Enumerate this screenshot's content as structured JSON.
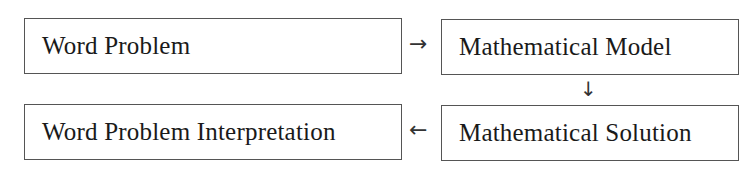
{
  "diagram": {
    "type": "flowchart",
    "nodes": [
      {
        "id": "word_problem",
        "label": "Word Problem"
      },
      {
        "id": "math_model",
        "label": "Mathematical Model"
      },
      {
        "id": "math_solution",
        "label": "Mathematical Solution"
      },
      {
        "id": "interpretation",
        "label": "Word Problem Interpretation"
      }
    ],
    "edges": [
      {
        "from": "word_problem",
        "to": "math_model",
        "glyph": "→"
      },
      {
        "from": "math_model",
        "to": "math_solution",
        "glyph": "↓"
      },
      {
        "from": "math_solution",
        "to": "interpretation",
        "glyph": "←"
      }
    ]
  },
  "colors": {
    "border": "#555555",
    "text": "#1a1a1a",
    "background": "#ffffff"
  }
}
